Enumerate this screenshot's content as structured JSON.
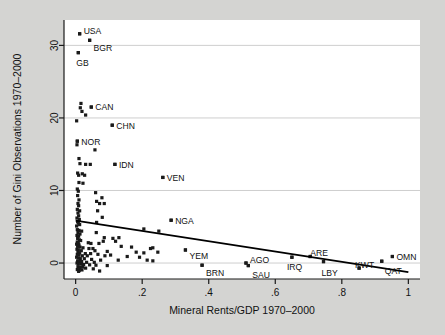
{
  "figure": {
    "background_color": "#d4d4d2",
    "plot_background_color": "#ffffff",
    "marker_color": "#1a1a1a",
    "grid_color": "#c9c9c9",
    "axis_color": "#1a1a1a",
    "trend_color": "#000000"
  },
  "chart_data": {
    "type": "scatter",
    "title": "",
    "xlabel": "Mineral Rents/GDP 1970–2000",
    "ylabel": "Number of Gini Observations 1970–2000",
    "xlim": [
      -0.035,
      1.035
    ],
    "ylim": [
      -2.2,
      33.5
    ],
    "xticks": [
      0,
      0.2,
      0.4,
      0.6,
      0.8,
      1
    ],
    "xticklabels": [
      "0",
      ".2",
      ".4",
      ".6",
      ".8",
      "1"
    ],
    "yticks": [
      0,
      10,
      20,
      30
    ],
    "yticklabels": [
      "0",
      "10",
      "20",
      "30"
    ],
    "grid": "horizontal",
    "legend": "none",
    "trendline": {
      "type": "linear",
      "x": [
        0.0,
        1.0
      ],
      "y": [
        5.85,
        -1.25
      ]
    },
    "labeled_points": [
      {
        "label": "USA",
        "x": 0.012,
        "y": 31.6,
        "label_dx": 4,
        "label_dy": -3
      },
      {
        "label": "BGR",
        "x": 0.042,
        "y": 30.7,
        "label_dx": 4,
        "label_dy": 8
      },
      {
        "label": "GB",
        "x": 0.008,
        "y": 29.0,
        "label_dx": -2,
        "label_dy": 10
      },
      {
        "label": "CAN",
        "x": 0.047,
        "y": 21.5,
        "label_dx": 4,
        "label_dy": 0
      },
      {
        "label": "CHN",
        "x": 0.11,
        "y": 19.0,
        "label_dx": 4,
        "label_dy": 1
      },
      {
        "label": "NOR",
        "x": 0.005,
        "y": 16.8,
        "label_dx": 4,
        "label_dy": 1
      },
      {
        "label": "IDN",
        "x": 0.118,
        "y": 13.6,
        "label_dx": 4,
        "label_dy": 1
      },
      {
        "label": "VEN",
        "x": 0.262,
        "y": 11.8,
        "label_dx": 4,
        "label_dy": 1
      },
      {
        "label": "NGA",
        "x": 0.287,
        "y": 5.9,
        "label_dx": 4,
        "label_dy": 1
      },
      {
        "label": "YEM",
        "x": 0.33,
        "y": 1.8,
        "label_dx": 4,
        "label_dy": 6
      },
      {
        "label": "BRN",
        "x": 0.38,
        "y": -0.3,
        "label_dx": 4,
        "label_dy": 8
      },
      {
        "label": "AGO",
        "x": 0.512,
        "y": 0.0,
        "label_dx": 4,
        "label_dy": -3
      },
      {
        "label": "SAU",
        "x": 0.519,
        "y": -0.35,
        "label_dx": 4,
        "label_dy": 9
      },
      {
        "label": "IRQ",
        "x": 0.65,
        "y": 0.8,
        "label_dx": -5,
        "label_dy": 10
      },
      {
        "label": "ARE",
        "x": 0.705,
        "y": 0.9,
        "label_dx": 0,
        "label_dy": -4
      },
      {
        "label": "LBY",
        "x": 0.745,
        "y": 0.2,
        "label_dx": -2,
        "label_dy": 11
      },
      {
        "label": "KWT",
        "x": 0.852,
        "y": -0.7,
        "label_dx": -4,
        "label_dy": -3
      },
      {
        "label": "QAT",
        "x": 0.92,
        "y": 0.25,
        "label_dx": 3,
        "label_dy": 10
      },
      {
        "label": "OMN",
        "x": 0.952,
        "y": 0.9,
        "label_dx": 4,
        "label_dy": 0
      }
    ],
    "points": [
      [
        0.012,
        31.6
      ],
      [
        0.042,
        30.7
      ],
      [
        0.008,
        29.0
      ],
      [
        0.016,
        22.0
      ],
      [
        0.014,
        21.4
      ],
      [
        0.047,
        21.5
      ],
      [
        0.019,
        20.9
      ],
      [
        0.03,
        20.4
      ],
      [
        0.003,
        19.6
      ],
      [
        0.11,
        19.0
      ],
      [
        0.005,
        16.8
      ],
      [
        0.004,
        16.3
      ],
      [
        0.058,
        15.6
      ],
      [
        0.01,
        14.4
      ],
      [
        0.013,
        13.7
      ],
      [
        0.03,
        13.6
      ],
      [
        0.044,
        13.6
      ],
      [
        0.118,
        13.6
      ],
      [
        0.006,
        12.4
      ],
      [
        0.009,
        12.1
      ],
      [
        0.02,
        12.3
      ],
      [
        0.027,
        12.1
      ],
      [
        0.262,
        11.8
      ],
      [
        0.01,
        11.1
      ],
      [
        0.022,
        11.0
      ],
      [
        0.005,
        10.2
      ],
      [
        0.008,
        9.9
      ],
      [
        0.06,
        9.7
      ],
      [
        0.006,
        9.3
      ],
      [
        0.079,
        9.0
      ],
      [
        0.01,
        8.7
      ],
      [
        0.063,
        8.5
      ],
      [
        0.007,
        8.2
      ],
      [
        0.009,
        7.9
      ],
      [
        0.072,
        8.2
      ],
      [
        0.086,
        8.2
      ],
      [
        0.005,
        7.4
      ],
      [
        0.012,
        7.2
      ],
      [
        0.066,
        7.2
      ],
      [
        0.007,
        6.9
      ],
      [
        0.009,
        6.5
      ],
      [
        0.08,
        6.3
      ],
      [
        0.004,
        6.2
      ],
      [
        0.011,
        6.0
      ],
      [
        0.287,
        5.9
      ],
      [
        0.006,
        5.7
      ],
      [
        0.008,
        5.5
      ],
      [
        0.063,
        5.6
      ],
      [
        0.012,
        5.3
      ],
      [
        0.003,
        5.1
      ],
      [
        0.205,
        4.7
      ],
      [
        0.25,
        4.4
      ],
      [
        0.005,
        4.6
      ],
      [
        0.01,
        4.5
      ],
      [
        0.018,
        4.4
      ],
      [
        0.007,
        4.2
      ],
      [
        0.013,
        4.0
      ],
      [
        0.062,
        4.2
      ],
      [
        0.004,
        3.8
      ],
      [
        0.009,
        3.7
      ],
      [
        0.086,
        3.5
      ],
      [
        0.112,
        3.4
      ],
      [
        0.13,
        3.5
      ],
      [
        0.006,
        3.4
      ],
      [
        0.011,
        3.2
      ],
      [
        0.015,
        3.1
      ],
      [
        0.083,
        3.0
      ],
      [
        0.12,
        3.0
      ],
      [
        0.005,
        2.9
      ],
      [
        0.008,
        2.8
      ],
      [
        0.038,
        2.8
      ],
      [
        0.046,
        2.7
      ],
      [
        0.07,
        2.7
      ],
      [
        0.003,
        2.6
      ],
      [
        0.01,
        2.5
      ],
      [
        0.137,
        2.3
      ],
      [
        0.168,
        2.2
      ],
      [
        0.006,
        2.3
      ],
      [
        0.013,
        2.2
      ],
      [
        0.022,
        2.1
      ],
      [
        0.04,
        2.0
      ],
      [
        0.052,
        2.0
      ],
      [
        0.225,
        2.0
      ],
      [
        0.232,
        2.1
      ],
      [
        0.33,
        1.8
      ],
      [
        0.004,
        1.9
      ],
      [
        0.008,
        1.8
      ],
      [
        0.017,
        1.7
      ],
      [
        0.058,
        1.7
      ],
      [
        0.095,
        1.6
      ],
      [
        0.182,
        1.5
      ],
      [
        0.205,
        1.4
      ],
      [
        0.247,
        1.5
      ],
      [
        0.007,
        1.5
      ],
      [
        0.012,
        1.4
      ],
      [
        0.029,
        1.3
      ],
      [
        0.045,
        1.3
      ],
      [
        0.067,
        1.2
      ],
      [
        0.005,
        1.2
      ],
      [
        0.01,
        1.1
      ],
      [
        0.02,
        1.0
      ],
      [
        0.035,
        1.0
      ],
      [
        0.088,
        1.0
      ],
      [
        0.105,
        1.1
      ],
      [
        0.155,
        0.9
      ],
      [
        0.192,
        0.8
      ],
      [
        0.65,
        0.8
      ],
      [
        0.705,
        0.9
      ],
      [
        0.952,
        0.9
      ],
      [
        0.003,
        0.8
      ],
      [
        0.009,
        0.7
      ],
      [
        0.014,
        0.6
      ],
      [
        0.026,
        0.6
      ],
      [
        0.048,
        0.5
      ],
      [
        0.075,
        0.4
      ],
      [
        0.128,
        0.4
      ],
      [
        0.215,
        0.4
      ],
      [
        0.232,
        0.3
      ],
      [
        0.92,
        0.25
      ],
      [
        0.006,
        0.3
      ],
      [
        0.011,
        0.2
      ],
      [
        0.018,
        0.2
      ],
      [
        0.033,
        0.1
      ],
      [
        0.056,
        0.1
      ],
      [
        0.512,
        0.0
      ],
      [
        0.745,
        0.2
      ],
      [
        0.004,
        0.0
      ],
      [
        0.008,
        -0.1
      ],
      [
        0.016,
        -0.15
      ],
      [
        0.024,
        -0.2
      ],
      [
        0.042,
        -0.25
      ],
      [
        0.061,
        -0.3
      ],
      [
        0.095,
        -0.35
      ],
      [
        0.38,
        -0.3
      ],
      [
        0.519,
        -0.35
      ],
      [
        0.007,
        -0.5
      ],
      [
        0.013,
        -0.6
      ],
      [
        0.021,
        -0.55
      ],
      [
        0.03,
        -0.7
      ],
      [
        0.053,
        -0.8
      ],
      [
        0.852,
        -0.7
      ],
      [
        0.005,
        -0.9
      ],
      [
        0.011,
        -1.0
      ],
      [
        0.019,
        -0.95
      ],
      [
        0.072,
        -1.1
      ],
      [
        0.009,
        -1.15
      ]
    ]
  }
}
